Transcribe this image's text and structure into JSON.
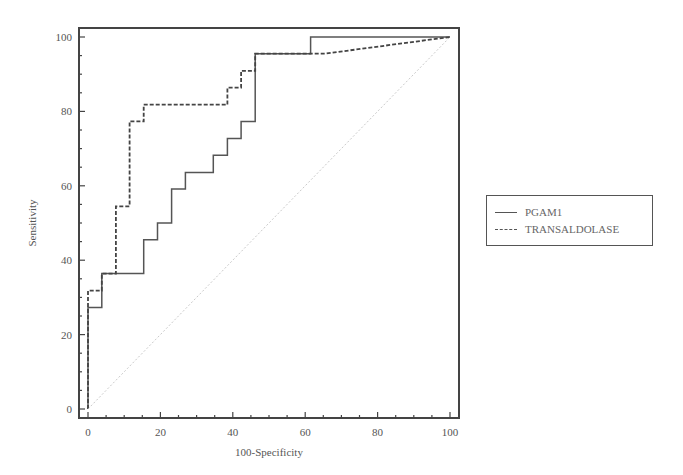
{
  "chart_data": {
    "type": "line",
    "subtype": "roc_step",
    "title": "",
    "xlabel": "100-Specificity",
    "ylabel": "Sensitivity",
    "xlim": [
      0,
      100
    ],
    "ylim": [
      0,
      100
    ],
    "xticks": [
      0,
      20,
      40,
      60,
      80,
      100
    ],
    "yticks": [
      0,
      20,
      40,
      60,
      80,
      100
    ],
    "grid": false,
    "legend_position": "right",
    "series": [
      {
        "name": "PGAM1",
        "style": "solid",
        "points": [
          [
            0,
            0
          ],
          [
            0,
            27.3
          ],
          [
            3.8,
            27.3
          ],
          [
            3.8,
            36.4
          ],
          [
            15.4,
            36.4
          ],
          [
            15.4,
            45.5
          ],
          [
            19.2,
            45.5
          ],
          [
            19.2,
            50
          ],
          [
            23.1,
            50
          ],
          [
            23.1,
            59.1
          ],
          [
            26.9,
            59.1
          ],
          [
            26.9,
            63.6
          ],
          [
            34.6,
            63.6
          ],
          [
            34.6,
            68.2
          ],
          [
            38.5,
            68.2
          ],
          [
            38.5,
            72.7
          ],
          [
            42.3,
            72.7
          ],
          [
            42.3,
            77.3
          ],
          [
            46.2,
            77.3
          ],
          [
            46.2,
            95.5
          ],
          [
            61.5,
            95.5
          ],
          [
            61.5,
            100
          ],
          [
            100,
            100
          ]
        ]
      },
      {
        "name": "TRANSALDOLASE",
        "style": "dashed",
        "points": [
          [
            0,
            0
          ],
          [
            0,
            31.8
          ],
          [
            3.8,
            31.8
          ],
          [
            3.8,
            36.4
          ],
          [
            7.7,
            36.4
          ],
          [
            7.7,
            54.5
          ],
          [
            11.5,
            54.5
          ],
          [
            11.5,
            77.3
          ],
          [
            15.4,
            77.3
          ],
          [
            15.4,
            81.8
          ],
          [
            38.5,
            81.8
          ],
          [
            38.5,
            86.4
          ],
          [
            42.3,
            86.4
          ],
          [
            42.3,
            90.9
          ],
          [
            46.2,
            90.9
          ],
          [
            46.2,
            95.5
          ],
          [
            65.4,
            95.5
          ],
          [
            100,
            100
          ]
        ]
      },
      {
        "name": "reference",
        "style": "dotted",
        "points": [
          [
            0,
            0
          ],
          [
            100,
            100
          ]
        ]
      }
    ]
  },
  "legend": {
    "items": [
      {
        "label": "PGAM1",
        "style": "solid"
      },
      {
        "label": "TRANSALDOLASE",
        "style": "dashed"
      }
    ]
  },
  "axes": {
    "x_title": "100-Specificity",
    "y_title": "Sensitivity"
  }
}
